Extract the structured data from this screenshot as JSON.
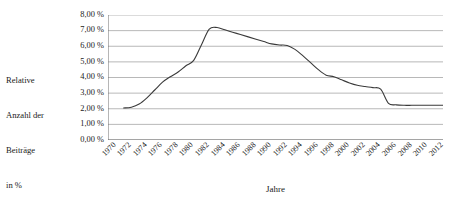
{
  "chart_data": {
    "type": "line",
    "title": "",
    "xlabel": "Jahre",
    "ylabel": "Relative Anzahl der Beiträge in %",
    "ylabel_lines": [
      "Relative",
      "Anzahl der",
      "Beiträge",
      "in %"
    ],
    "grid": true,
    "legend": false,
    "line_color": "#3a3a3a",
    "grid_color": "#9a9a9a",
    "axis_color": "#6e6e6e",
    "xlim": [
      1970,
      2013
    ],
    "ylim": [
      0,
      8
    ],
    "y_tick_values": [
      8,
      7,
      6,
      5,
      4,
      3,
      2,
      1,
      0
    ],
    "y_tick_labels": [
      "8,00 %",
      "7,00 %",
      "6,00 %",
      "5,00 %",
      "4,00 %",
      "3,00 %",
      "2,00 %",
      "1,00 %",
      "0,00 %"
    ],
    "x_tick_labels": [
      "1970",
      "1972",
      "1974",
      "1976",
      "1978",
      "1980",
      "1982",
      "1984",
      "1986",
      "1988",
      "1990",
      "1992",
      "1994",
      "1996",
      "1998",
      "2000",
      "2002",
      "2004",
      "2006",
      "2008",
      "2010",
      "2012"
    ],
    "x_minor_tick_step": 1,
    "series": [
      {
        "name": "Relative Anzahl der Beiträge",
        "x": [
          1972,
          1973,
          1974,
          1975,
          1976,
          1977,
          1978,
          1979,
          1980,
          1981,
          1982,
          1983,
          1984,
          1985,
          1986,
          1987,
          1988,
          1989,
          1990,
          1991,
          1992,
          1993,
          1994,
          1995,
          1996,
          1997,
          1998,
          1999,
          2000,
          2001,
          2002,
          2003,
          2004,
          2005,
          2006,
          2007,
          2008,
          2009,
          2010,
          2011,
          2012,
          2013
        ],
        "values": [
          2.05,
          2.1,
          2.3,
          2.7,
          3.2,
          3.7,
          4.05,
          4.35,
          4.75,
          5.1,
          6.1,
          7.1,
          7.2,
          7.05,
          6.9,
          6.75,
          6.6,
          6.45,
          6.3,
          6.15,
          6.08,
          6.05,
          5.8,
          5.4,
          4.95,
          4.5,
          4.15,
          4.05,
          3.85,
          3.65,
          3.5,
          3.42,
          3.35,
          3.25,
          2.35,
          2.25,
          2.22,
          2.22,
          2.22,
          2.22,
          2.22,
          2.22
        ]
      }
    ]
  }
}
